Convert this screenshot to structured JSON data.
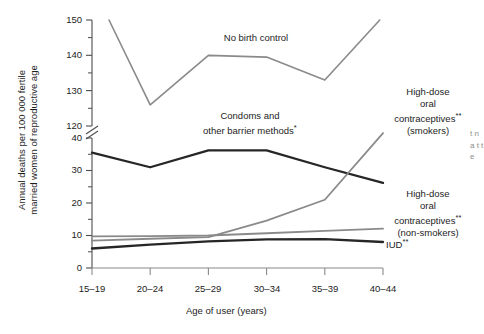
{
  "chart_data": {
    "type": "line",
    "title": "",
    "xlabel": "Age of user (years)",
    "ylabel": "Annual deaths per 100 000 fertile married women of reproductive age",
    "categories": [
      "15–19",
      "20–24",
      "25–29",
      "30–34",
      "35–39",
      "40–44"
    ],
    "axis_break": {
      "lower_max": 40,
      "upper_min": 120,
      "note": "y-axis is broken between 40 and 120"
    },
    "ylim_lower": [
      0,
      40
    ],
    "ylim_upper": [
      120,
      150
    ],
    "ytick_labels_lower": [
      "0",
      "10",
      "20",
      "30",
      "40"
    ],
    "ytick_labels_upper": [
      "120",
      "130",
      "140",
      "150"
    ],
    "grid": false,
    "legend": "inline annotations on plot",
    "series": [
      {
        "name": "No birth control",
        "color": "#8a8a8a",
        "width": 1.6,
        "values": [
          150,
          126,
          140,
          139.5,
          133,
          151
        ],
        "starts_offset": true,
        "label": "No birth control"
      },
      {
        "name": "Condoms and other barrier methods*",
        "color": "#262626",
        "width": 2.3,
        "values": [
          35.5,
          31,
          36.2,
          36.2,
          31,
          26.2
        ],
        "label": "Condoms and\nother barrier methods*"
      },
      {
        "name": "High-dose oral contraceptives** (smokers)",
        "color": "#8a8a8a",
        "width": 1.8,
        "values": [
          8.4,
          9.0,
          9.5,
          14.6,
          21.0,
          118
        ],
        "label": "High-dose\noral\ncontraceptives**\n(smokers)"
      },
      {
        "name": "High-dose oral contraceptives** (non-smokers)",
        "color": "#8a8a8a",
        "width": 1.8,
        "values": [
          9.7,
          9.8,
          10.0,
          10.7,
          11.4,
          12.1
        ],
        "label": "High-dose\noral\ncontraceptives**\n(non-smokers)"
      },
      {
        "name": "IUD**",
        "color": "#262626",
        "width": 2.3,
        "values": [
          6.0,
          7.2,
          8.2,
          8.8,
          8.9,
          8.0
        ],
        "label": "IUD**"
      }
    ]
  },
  "annotations": {
    "no_birth_control": "No birth control",
    "condoms_line1": "Condoms and",
    "condoms_line2": "other barrier methods",
    "condoms_mark": "*",
    "hdoc_smokers_line1": "High-dose",
    "hdoc_smokers_line2": "oral",
    "hdoc_smokers_line3": "contraceptives",
    "hdoc_smokers_mark": "**",
    "hdoc_smokers_line4": "(smokers)",
    "hdoc_non_line1": "High-dose",
    "hdoc_non_line2": "oral",
    "hdoc_non_line3": "contraceptives",
    "hdoc_non_mark": "**",
    "hdoc_non_line4": "(non-smokers)",
    "iud_label": "IUD",
    "iud_mark": "**"
  },
  "axes": {
    "y_title_line1": "Annual deaths per 100 000 fertile",
    "y_title_line2": "married women of reproductive age",
    "x_title": "Age of user (years)",
    "y_ticks": [
      "150",
      "140",
      "130",
      "120",
      "40",
      "30",
      "20",
      "10",
      "0"
    ],
    "x_ticks": [
      "15–19",
      "20–24",
      "25–29",
      "30–34",
      "35–39",
      "40–44"
    ]
  },
  "edge": {
    "cut_text": "t n a t t e"
  },
  "colors": {
    "dark_series": "#262626",
    "light_series": "#8a8a8a",
    "axis": "#4d4d4d",
    "text": "#1d1d1d",
    "background": "#ffffff"
  }
}
